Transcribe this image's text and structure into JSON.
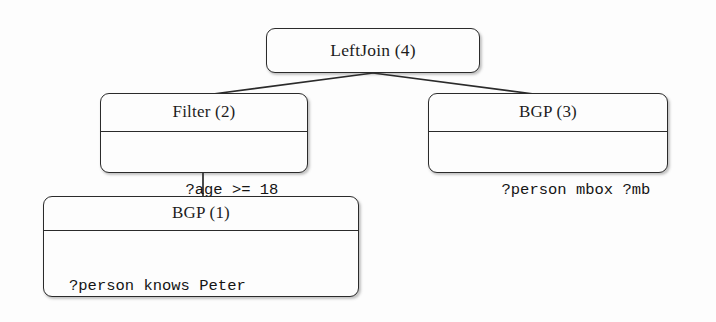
{
  "diagram": {
    "background_color": "#fdfdfd",
    "stroke_color": "#2b2b2b",
    "nodes": {
      "leftjoin": {
        "header": "LeftJoin (4)",
        "body_lines": []
      },
      "filter": {
        "header": "Filter (2)",
        "body_lines": [
          "?age >= 18"
        ]
      },
      "bgp3": {
        "header": "BGP (3)",
        "body_lines": [
          "?person mbox ?mb"
        ]
      },
      "bgp1": {
        "header": "BGP (1)",
        "body_lines": [
          "?person knows Peter",
          "?person age ?age"
        ]
      }
    },
    "edges": [
      {
        "name": "leftjoin-to-filter",
        "from": "leftjoin",
        "to": "filter"
      },
      {
        "name": "leftjoin-to-bgp3",
        "from": "leftjoin",
        "to": "bgp3"
      },
      {
        "name": "filter-to-bgp1",
        "from": "filter",
        "to": "bgp1"
      }
    ]
  }
}
